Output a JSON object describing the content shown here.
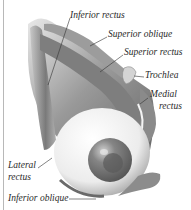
{
  "figure": {
    "labels": {
      "inferior_rectus": "Inferior rectus",
      "superior_oblique": "Superior oblique",
      "superior_rectus": "Superior rectus",
      "trochlea": "Trochlea",
      "medial_rectus_1": "Medial",
      "medial_rectus_2": "rectus",
      "lateral_rectus_1": "Lateral",
      "lateral_rectus_2": "rectus",
      "inferior_oblique": "Inferior oblique"
    }
  },
  "colors": {
    "muscle": "#9a9a9a",
    "muscle_dark": "#5e5e5e",
    "eyeball": "#f2f2f2",
    "iris": "#7a7a7a",
    "pupil": "#4a4a4a",
    "leader_line": "#333333",
    "border": "#b8b8b8"
  }
}
